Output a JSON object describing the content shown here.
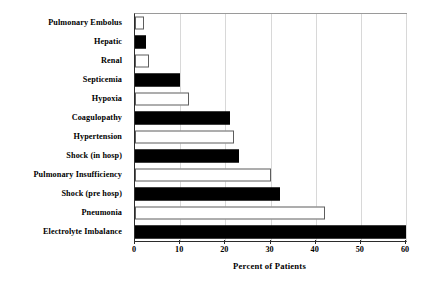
{
  "chart_data": {
    "type": "bar",
    "orientation": "horizontal",
    "title": "",
    "xlabel": "Percent of Patients",
    "ylabel": "",
    "xlim": [
      0,
      60
    ],
    "ylim": null,
    "xticks": [
      0,
      10,
      20,
      30,
      40,
      50,
      60
    ],
    "xtick_labels": [
      "0",
      "10",
      "20",
      "30",
      "40",
      "50",
      "60"
    ],
    "grid": true,
    "grid_axis": "x",
    "legend": null,
    "categories": [
      "Pulmonary Embolus",
      "Hepatic",
      "Renal",
      "Septicemia",
      "Hypoxia",
      "Coagulopathy",
      "Hypertension",
      "Shock (in hosp)",
      "Pulmonary Insufficiency",
      "Shock (pre hosp)",
      "Pneumonia",
      "Electrolyte Imbalance"
    ],
    "values": [
      2,
      2.5,
      3,
      10,
      12,
      21,
      22,
      23,
      30,
      32,
      42,
      60
    ],
    "bar_styles": [
      "open",
      "filled",
      "open",
      "filled",
      "open",
      "filled",
      "open",
      "filled",
      "open",
      "filled",
      "open",
      "filled"
    ],
    "colors": {
      "filled": "#000000",
      "open": "#ffffff",
      "open_edge": "#5d5d5d",
      "axis": "#2b2b2b",
      "grid": "#d8d8d8",
      "text": "#000000",
      "background": "#ffffff"
    }
  }
}
